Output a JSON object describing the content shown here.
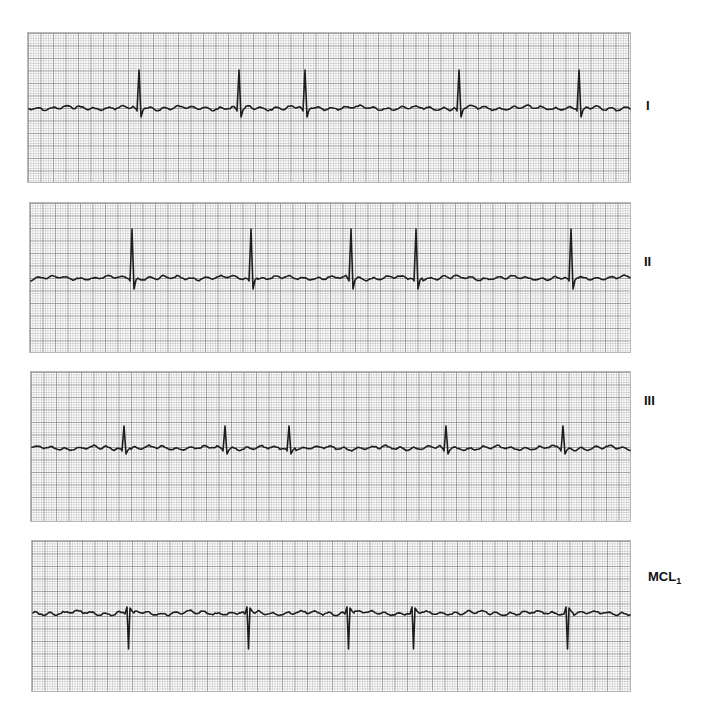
{
  "chart_data": {
    "type": "line",
    "title": "",
    "grid": true,
    "leads": [
      {
        "name": "I",
        "label": "I",
        "box": {
          "x": 27,
          "y": 32,
          "w": 604,
          "h": 151
        },
        "baseline_y": 107,
        "polarity": "positive",
        "r_peak_y": 69,
        "s_dip_y": 116,
        "qrs_x": [
          138,
          238,
          304,
          458,
          578
        ]
      },
      {
        "name": "II",
        "label": "II",
        "box": {
          "x": 29,
          "y": 202,
          "w": 602,
          "h": 151
        },
        "baseline_y": 277,
        "polarity": "positive",
        "r_peak_y": 228,
        "s_dip_y": 288,
        "qrs_x": [
          131,
          250,
          350,
          415,
          570
        ]
      },
      {
        "name": "III",
        "label": "III",
        "box": {
          "x": 30,
          "y": 371,
          "w": 601,
          "h": 151
        },
        "baseline_y": 447,
        "polarity": "positive",
        "r_peak_y": 425,
        "s_dip_y": 453,
        "qrs_x": [
          123,
          224,
          288,
          445,
          562
        ]
      },
      {
        "name": "MCL1",
        "label": "MCL",
        "label_sub": "1",
        "box": {
          "x": 31,
          "y": 540,
          "w": 600,
          "h": 152
        },
        "baseline_y": 612,
        "polarity": "negative",
        "r_peak_y": 606,
        "s_dip_y": 648,
        "qrs_x": [
          127,
          247,
          347,
          412,
          566
        ]
      }
    ],
    "label_x": 648,
    "label_y": [
      105,
      261,
      400,
      576
    ],
    "trace_color": "#1e1e1e",
    "grid_minor_px": 2.5,
    "grid_major_px": 12.5
  },
  "labels": {
    "lead1": "I",
    "lead2": "II",
    "lead3": "III",
    "lead4": "MCL",
    "lead4_sub": "1"
  }
}
